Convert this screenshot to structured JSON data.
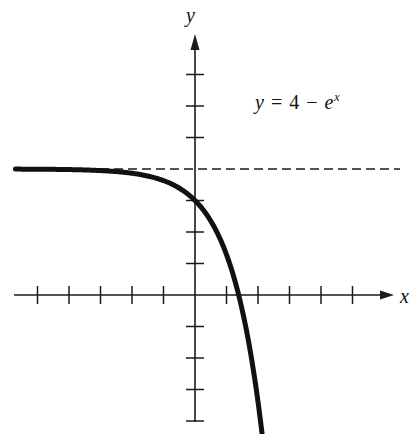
{
  "chart_data": {
    "type": "line",
    "title": "",
    "annotation": "y = 4 − e^x",
    "equation": {
      "lhs": "y",
      "op1": "=",
      "const": "4",
      "op2": "−",
      "base": "e",
      "exp": "x"
    },
    "xlabel": "x",
    "ylabel": "y",
    "xlim": [
      -5.8,
      6.3
    ],
    "ylim": [
      -4.1,
      8.7
    ],
    "x_ticks": [
      -5,
      -4,
      -3,
      -2,
      -1,
      1,
      2,
      3,
      4,
      5
    ],
    "y_ticks": [
      -4,
      -3,
      -2,
      -1,
      1,
      2,
      3,
      4,
      5,
      6,
      7
    ],
    "tick_labels_shown": false,
    "grid": false,
    "asymptote": {
      "y": 4,
      "style": "dashed"
    },
    "series": [
      {
        "name": "y = 4 - e^x",
        "function": "4 - exp(x)",
        "domain": [
          -5.7,
          2.13
        ],
        "x": [
          -5.7,
          -5,
          -4,
          -3,
          -2,
          -1,
          0,
          0.5,
          1,
          1.386,
          1.7,
          2.0,
          2.13
        ],
        "y": [
          3.997,
          3.993,
          3.982,
          3.95,
          3.865,
          3.632,
          3.0,
          2.351,
          1.282,
          0.0,
          -1.474,
          -3.389,
          -4.41
        ]
      }
    ],
    "key_points": {
      "y_intercept": [
        0,
        3
      ],
      "x_intercept": [
        1.386,
        0
      ]
    }
  },
  "labels": {
    "x_axis": "x",
    "y_axis": "y"
  },
  "colors": {
    "curve": "#111111",
    "axes": "#1a1a1a",
    "background": "#ffffff"
  }
}
